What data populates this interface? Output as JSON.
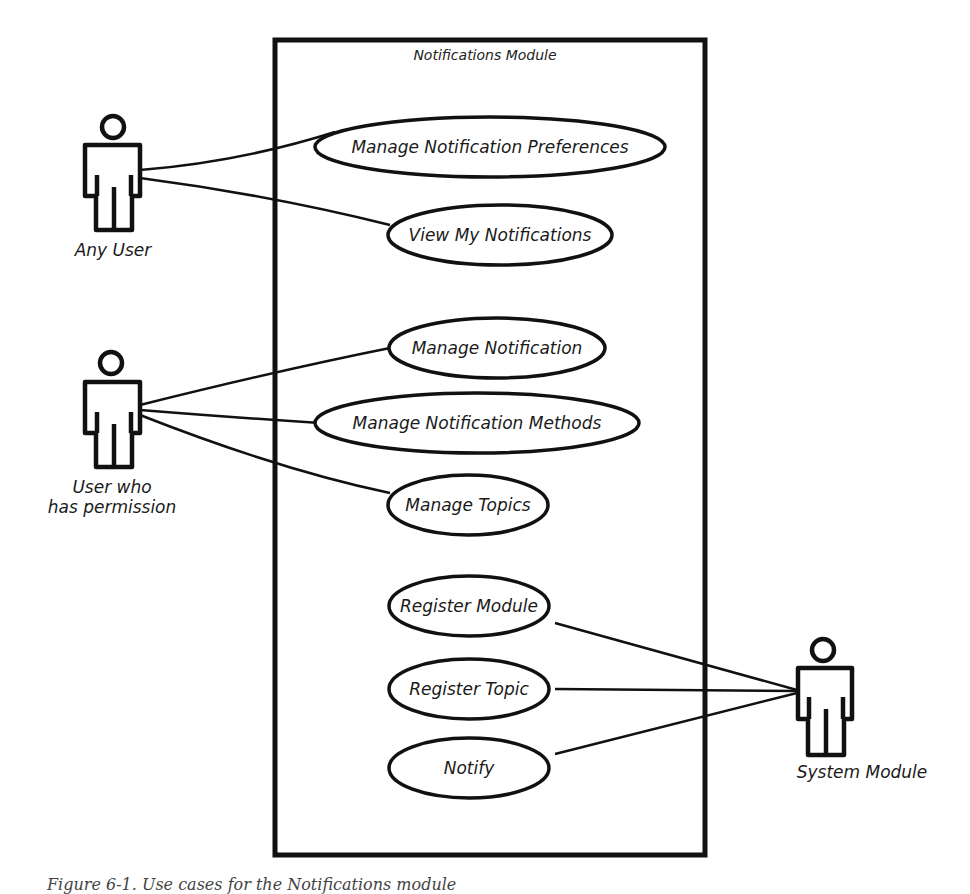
{
  "diagram": {
    "type": "uml-use-case",
    "system_boundary": {
      "title": "Notifications Module"
    },
    "actors": [
      {
        "id": "any-user",
        "label": "Any User"
      },
      {
        "id": "permitted-user",
        "label_line1": "User who",
        "label_line2": "has permission"
      },
      {
        "id": "system-module",
        "label": "System Module"
      }
    ],
    "use_cases": [
      {
        "id": "uc1",
        "label": "Manage Notification Preferences"
      },
      {
        "id": "uc2",
        "label": "View My Notifications"
      },
      {
        "id": "uc3",
        "label": "Manage Notification"
      },
      {
        "id": "uc4",
        "label": "Manage Notification Methods"
      },
      {
        "id": "uc5",
        "label": "Manage Topics"
      },
      {
        "id": "uc6",
        "label": "Register Module"
      },
      {
        "id": "uc7",
        "label": "Register Topic"
      },
      {
        "id": "uc8",
        "label": "Notify"
      }
    ],
    "associations": [
      [
        "Any User",
        "Manage Notification Preferences"
      ],
      [
        "Any User",
        "View My Notifications"
      ],
      [
        "User who has permission",
        "Manage Notification"
      ],
      [
        "User who has permission",
        "Manage Notification Methods"
      ],
      [
        "User who has permission",
        "Manage Topics"
      ],
      [
        "System Module",
        "Register Module"
      ],
      [
        "System Module",
        "Register Topic"
      ],
      [
        "System Module",
        "Notify"
      ]
    ]
  },
  "caption": "Figure 6-1. Use cases for the Notifications module"
}
